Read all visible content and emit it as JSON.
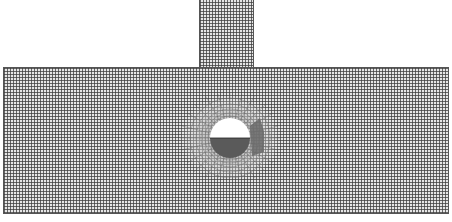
{
  "figure": {
    "regions": [
      "top-block",
      "main-block",
      "circular-opening"
    ],
    "colors": {
      "background": "#ffffff",
      "mesh_lines": "#3c3c3c",
      "mesh_fill": "#e6e6e6",
      "opening": "#ffffff",
      "lower_half_fill": "#5a5a5a"
    }
  }
}
